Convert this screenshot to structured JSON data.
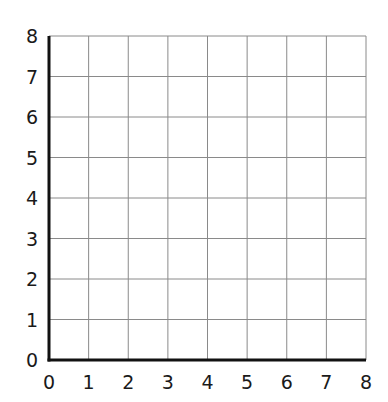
{
  "chart_data": {
    "type": "scatter",
    "title": "",
    "xlabel": "",
    "ylabel": "",
    "xlim": [
      0,
      8
    ],
    "ylim": [
      0,
      8
    ],
    "grid": true,
    "x_ticks": [
      "0",
      "1",
      "2",
      "3",
      "4",
      "5",
      "6",
      "7",
      "8"
    ],
    "y_ticks": [
      "0",
      "1",
      "2",
      "3",
      "4",
      "5",
      "6",
      "7",
      "8"
    ],
    "series": [],
    "legend": null
  },
  "colors": {
    "axis": "#111111",
    "grid": "#8a8a8a",
    "text": "#1a1a1a",
    "background": "#ffffff"
  },
  "layout": {
    "origin_x": 49,
    "origin_y": 360,
    "right_x": 366,
    "top_y": 36
  }
}
